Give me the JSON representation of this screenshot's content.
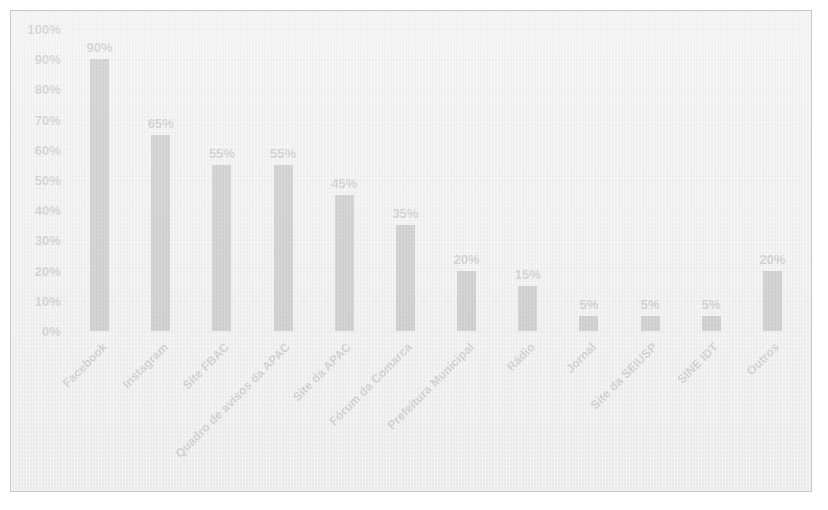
{
  "chart_data": {
    "type": "bar",
    "title": "",
    "subtitle": "",
    "xlabel": "",
    "ylabel": "",
    "ylim": [
      0,
      100
    ],
    "grid": true,
    "legend": "none",
    "value_suffix": "%",
    "categories": [
      "Facebook",
      "Instagram",
      "Site FBAC",
      "Quadro de avisos da APAC",
      "Site da APAC",
      "Fórum da Comarca",
      "Prefeitura Municipal",
      "Rádio",
      "Jornal",
      "Site da SEIUSP",
      "SINE IDT",
      "Outros"
    ],
    "values": [
      90,
      65,
      55,
      55,
      45,
      35,
      20,
      15,
      5,
      5,
      5,
      20
    ],
    "value_labels": [
      "90%",
      "65%",
      "55%",
      "55%",
      "45%",
      "35%",
      "20%",
      "15%",
      "5%",
      "5%",
      "5%",
      "20%"
    ],
    "yticks": [
      0,
      10,
      20,
      30,
      40,
      50,
      60,
      70,
      80,
      90,
      100
    ],
    "ytick_labels": [
      "0%",
      "10%",
      "20%",
      "30%",
      "40%",
      "50%",
      "60%",
      "70%",
      "80%",
      "90%",
      "100%"
    ],
    "colors": {
      "bar": "#1f1f1f",
      "background": "#eeeeee",
      "gridline": "#dcdcdc",
      "border": "#c9c9c9",
      "text": "#232323"
    }
  }
}
